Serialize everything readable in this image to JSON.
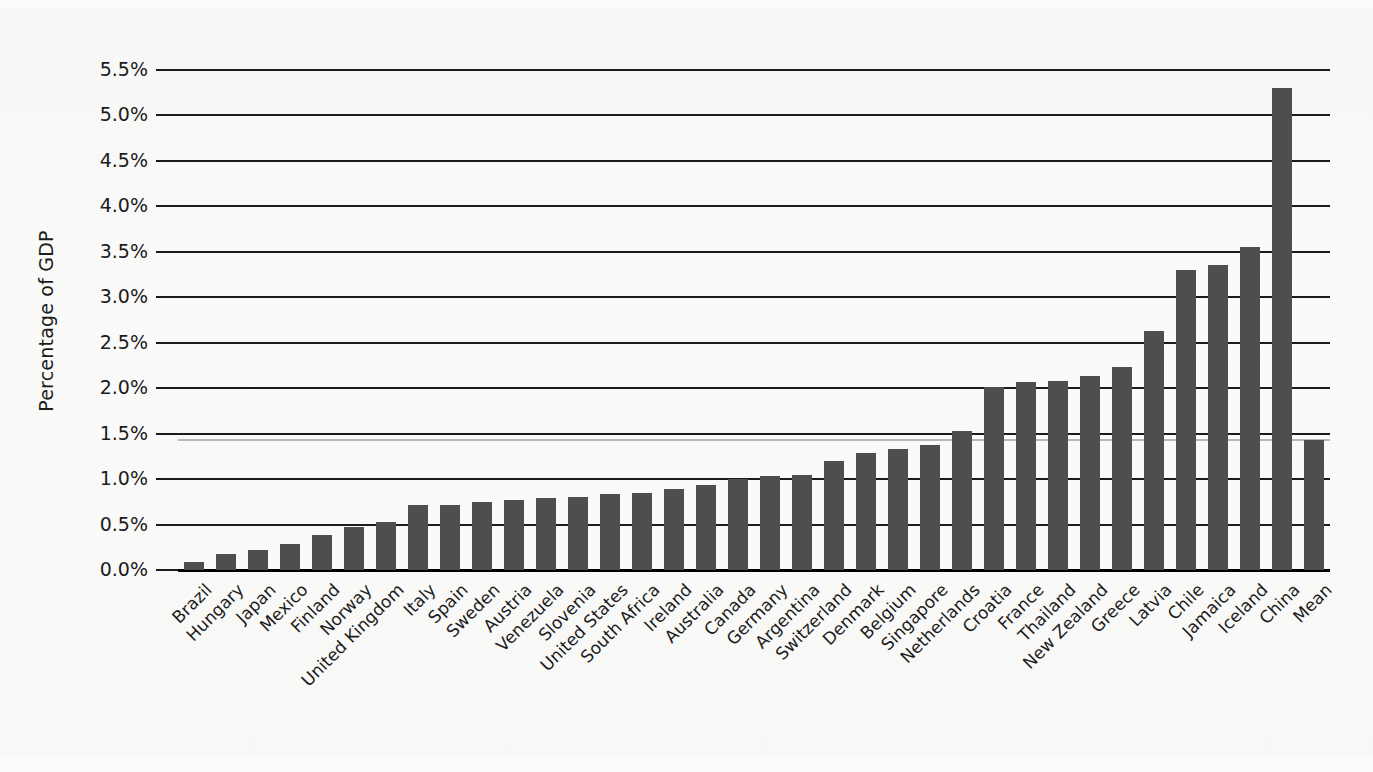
{
  "chart_data": {
    "type": "bar",
    "title": "",
    "subtitle": "",
    "xlabel": "",
    "ylabel": "Percentage of GDP",
    "ylim": [
      0.0,
      5.5
    ],
    "ytick_values": [
      0.0,
      0.5,
      1.0,
      1.5,
      2.0,
      2.5,
      3.0,
      3.5,
      4.0,
      4.5,
      5.0,
      5.5
    ],
    "ytick_labels": [
      "0.0%",
      "0.5%",
      "1.0%",
      "1.5%",
      "2.0%",
      "2.5%",
      "3.0%",
      "3.5%",
      "4.0%",
      "4.5%",
      "5.0%",
      "5.5%"
    ],
    "grid": true,
    "grid_orientation": "horizontal",
    "legend": false,
    "legend_position": "none",
    "bar_color": "#4e4e4e",
    "categories": [
      "Brazil",
      "Hungary",
      "Japan",
      "Mexico",
      "Finland",
      "Norway",
      "United Kingdom",
      "Italy",
      "Spain",
      "Sweden",
      "Austria",
      "Venezuela",
      "Slovenia",
      "United States",
      "South Africa",
      "Ireland",
      "Australia",
      "Canada",
      "Germany",
      "Argentina",
      "Switzerland",
      "Denmark",
      "Belgium",
      "Singapore",
      "Netherlands",
      "Croatia",
      "France",
      "Thailand",
      "New Zealand",
      "Greece",
      "Latvia",
      "Chile",
      "Jamaica",
      "Iceland",
      "China",
      "Mean"
    ],
    "values": [
      0.09,
      0.18,
      0.22,
      0.29,
      0.38,
      0.47,
      0.53,
      0.71,
      0.71,
      0.75,
      0.77,
      0.79,
      0.8,
      0.84,
      0.85,
      0.89,
      0.94,
      1.0,
      1.03,
      1.05,
      1.2,
      1.29,
      1.33,
      1.37,
      1.53,
      2.01,
      2.07,
      2.08,
      2.13,
      2.23,
      2.63,
      3.3,
      3.35,
      3.55,
      5.3,
      1.43
    ],
    "value_suffix": "%"
  }
}
